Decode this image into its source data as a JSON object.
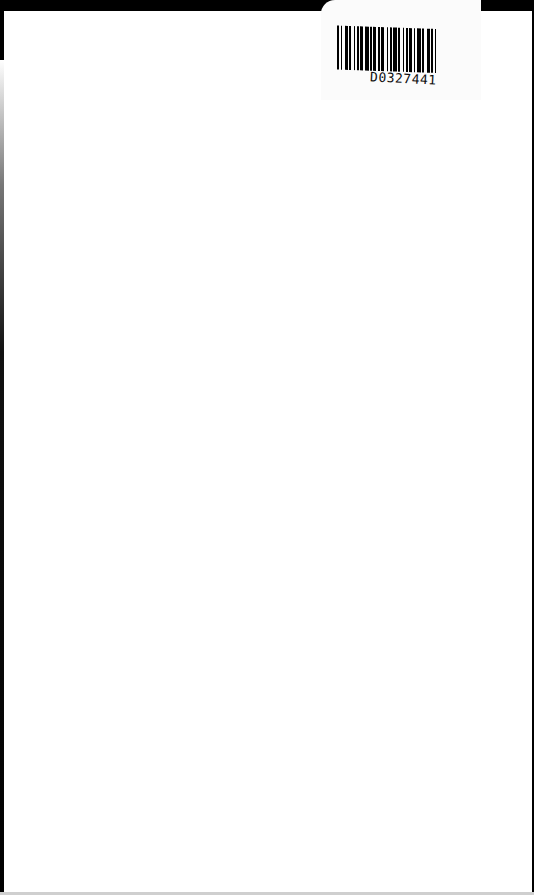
{
  "document": {
    "type": "scanned-page",
    "content": "blank"
  },
  "label": {
    "barcode_text": "D0327441",
    "barcode_icon": "barcode-icon"
  },
  "colors": {
    "background": "#ffffff",
    "scan_border": "#000000"
  }
}
